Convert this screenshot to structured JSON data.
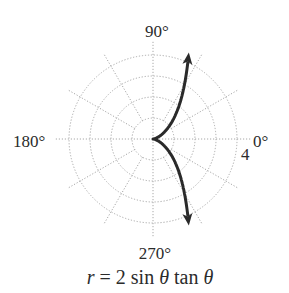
{
  "chart_data": {
    "type": "line",
    "coordinate_system": "polar",
    "title": "r = 2 sin θ tan θ",
    "caption": {
      "r": "r",
      "eq": " = 2 sin ",
      "theta1": "θ",
      "tan": " tan ",
      "theta2": "θ"
    },
    "angle_labels": {
      "deg0": "0°",
      "deg90": "90°",
      "deg180": "180°",
      "deg270": "270°"
    },
    "radial_tick_label": "4",
    "radial_rings": [
      1,
      2,
      3,
      4
    ],
    "rlim": [
      0,
      4
    ],
    "angular_gridlines_deg": [
      0,
      30,
      60,
      90,
      120,
      150,
      180,
      210,
      240,
      270,
      300,
      330
    ],
    "grid": true,
    "series": [
      {
        "name": "r = 2 sin θ tan θ",
        "equation": "r = 2*sin(theta)*tan(theta)",
        "theta_range_deg": [
          -67.5,
          67.5
        ],
        "arrows_at_ends": true,
        "sample_points": [
          {
            "theta_deg": -67.5,
            "r": 4.46
          },
          {
            "theta_deg": -60,
            "r": 3.0
          },
          {
            "theta_deg": -45,
            "r": 1.41
          },
          {
            "theta_deg": -30,
            "r": 0.58
          },
          {
            "theta_deg": 0,
            "r": 0
          },
          {
            "theta_deg": 30,
            "r": 0.58
          },
          {
            "theta_deg": 45,
            "r": 1.41
          },
          {
            "theta_deg": 60,
            "r": 3.0
          },
          {
            "theta_deg": 67.5,
            "r": 4.46
          }
        ]
      }
    ],
    "colors": {
      "curve": "#2a2a2a",
      "grid": "#a8a8a8",
      "text": "#2b2b2b"
    }
  }
}
